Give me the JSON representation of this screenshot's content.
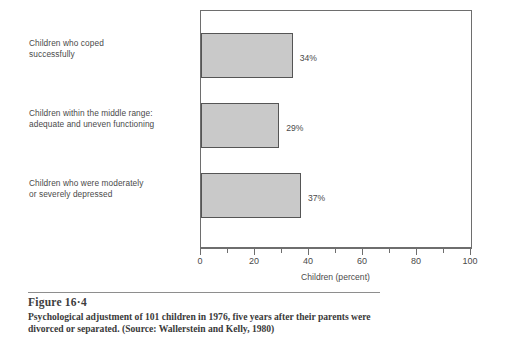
{
  "chart_data": {
    "type": "bar",
    "orientation": "horizontal",
    "title": "",
    "xlabel": "Children (percent)",
    "ylabel": "",
    "xlim": [
      0,
      100
    ],
    "xticks": [
      0,
      10,
      20,
      30,
      40,
      50,
      60,
      70,
      80,
      90,
      100
    ],
    "xtick_labels": [
      "0",
      "",
      "20",
      "",
      "40",
      "",
      "60",
      "",
      "80",
      "",
      "100"
    ],
    "grid": false,
    "legend": null,
    "bar_color": "#c9c9c9",
    "bar_edge_color": "#555555",
    "categories": [
      "Children who coped successfully",
      "Children within the middle range: adequate and uneven functioning",
      "Children who were moderately or severely depressed"
    ],
    "values": [
      34,
      29,
      37
    ],
    "data_labels": [
      "34%",
      "29%",
      "37%"
    ]
  },
  "category_labels": [
    {
      "line1": "Children who coped",
      "line2": "successfully"
    },
    {
      "line1": "Children within the middle range:",
      "line2": "adequate and uneven functioning"
    },
    {
      "line1": "Children who were moderately",
      "line2": "or severely depressed"
    }
  ],
  "axis": {
    "title": "Children (percent)",
    "labels": [
      "0",
      "20",
      "40",
      "60",
      "80",
      "100"
    ]
  },
  "caption": {
    "figure_number": "Figure 16·4",
    "text": "Psychological adjustment of 101 children in 1976, five years after their parents were divorced or separated. (Source: Wallerstein and Kelly, 1980)"
  }
}
